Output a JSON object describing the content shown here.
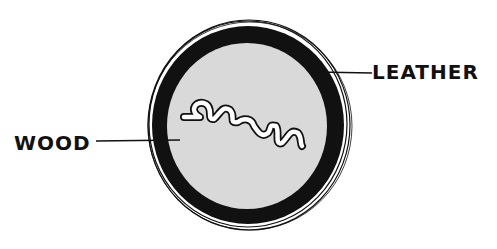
{
  "diagram": {
    "labels": {
      "wood": "WOOD",
      "leather": "LEATHER"
    },
    "colors": {
      "background": "#ffffff",
      "ring": "#111111",
      "core": "#d9d9d9",
      "ink": "#111111"
    }
  }
}
